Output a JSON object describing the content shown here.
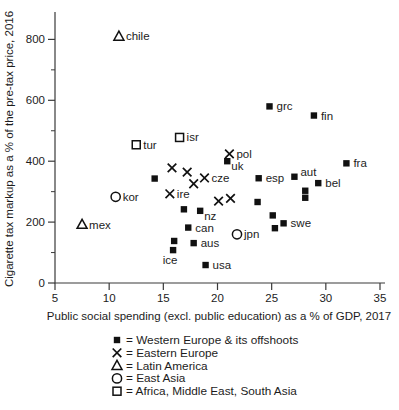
{
  "chart_data": {
    "type": "scatter",
    "title": "",
    "xlabel": "Public social spending (excl. public education) as a % of GDP, 2017",
    "ylabel": "Cigarette tax markup as a % of the pre-tax price, 2016",
    "xlim": [
      5,
      35
    ],
    "ylim": [
      0,
      890
    ],
    "x_ticks": [
      5,
      10,
      15,
      20,
      25,
      30,
      35
    ],
    "y_ticks": [
      0,
      200,
      400,
      600,
      800
    ],
    "y_minor_ticks": [
      100,
      300,
      500,
      700
    ],
    "grid": "off",
    "legend_position": "bottom",
    "marker_color": "#111111",
    "series": [
      {
        "name": "Western Europe & its offshoots",
        "marker": "square-filled",
        "points": [
          {
            "x": 24.8,
            "y": 580,
            "label": "grc"
          },
          {
            "x": 28.9,
            "y": 550,
            "label": "fin"
          },
          {
            "x": 31.9,
            "y": 393,
            "label": "fra"
          },
          {
            "x": 20.9,
            "y": 400,
            "label": "uk",
            "label_pos": "right-low"
          },
          {
            "x": 23.8,
            "y": 344,
            "label": "esp"
          },
          {
            "x": 27.1,
            "y": 349,
            "label": "aut",
            "label_pos": "right-high"
          },
          {
            "x": 29.3,
            "y": 328,
            "label": "bel"
          },
          {
            "x": 26.1,
            "y": 196,
            "label": "swe"
          },
          {
            "x": 18.4,
            "y": 237,
            "label": "nz",
            "label_pos": "right-low"
          },
          {
            "x": 17.3,
            "y": 182,
            "label": "can"
          },
          {
            "x": 17.8,
            "y": 131,
            "label": "aus"
          },
          {
            "x": 15.9,
            "y": 108,
            "label": "ice",
            "label_pos": "below"
          },
          {
            "x": 18.9,
            "y": 59,
            "label": "usa"
          },
          {
            "x": 14.2,
            "y": 343
          },
          {
            "x": 16.9,
            "y": 242
          },
          {
            "x": 16.0,
            "y": 138
          },
          {
            "x": 23.7,
            "y": 266
          },
          {
            "x": 25.1,
            "y": 222
          },
          {
            "x": 25.3,
            "y": 180
          },
          {
            "x": 28.1,
            "y": 303
          },
          {
            "x": 28.1,
            "y": 280
          }
        ]
      },
      {
        "name": "Eastern Europe",
        "marker": "x-cross",
        "points": [
          {
            "x": 21.1,
            "y": 424,
            "label": "pol"
          },
          {
            "x": 18.8,
            "y": 345,
            "label": "cze"
          },
          {
            "x": 15.6,
            "y": 293,
            "label": "ire"
          },
          {
            "x": 15.8,
            "y": 378
          },
          {
            "x": 17.2,
            "y": 364
          },
          {
            "x": 17.8,
            "y": 326
          },
          {
            "x": 20.1,
            "y": 269
          },
          {
            "x": 21.2,
            "y": 278
          }
        ]
      },
      {
        "name": "Latin America",
        "marker": "triangle-open",
        "points": [
          {
            "x": 10.9,
            "y": 810,
            "label": "chile"
          },
          {
            "x": 7.5,
            "y": 192,
            "label": "mex"
          }
        ]
      },
      {
        "name": "East Asia",
        "marker": "circle-open",
        "points": [
          {
            "x": 10.6,
            "y": 283,
            "label": "kor"
          },
          {
            "x": 21.8,
            "y": 160,
            "label": "jpn"
          }
        ]
      },
      {
        "name": "Africa, Middle East, South Asia",
        "marker": "square-open",
        "points": [
          {
            "x": 16.5,
            "y": 478,
            "label": "isr"
          },
          {
            "x": 12.5,
            "y": 454,
            "label": "tur"
          }
        ]
      }
    ],
    "legend": [
      {
        "marker": "square-filled",
        "label": "= Western Europe & its offshoots"
      },
      {
        "marker": "x-cross",
        "label": "= Eastern Europe"
      },
      {
        "marker": "triangle-open",
        "label": "= Latin America"
      },
      {
        "marker": "circle-open",
        "label": "= East Asia"
      },
      {
        "marker": "square-open",
        "label": "= Africa, Middle East, South Asia"
      }
    ]
  }
}
